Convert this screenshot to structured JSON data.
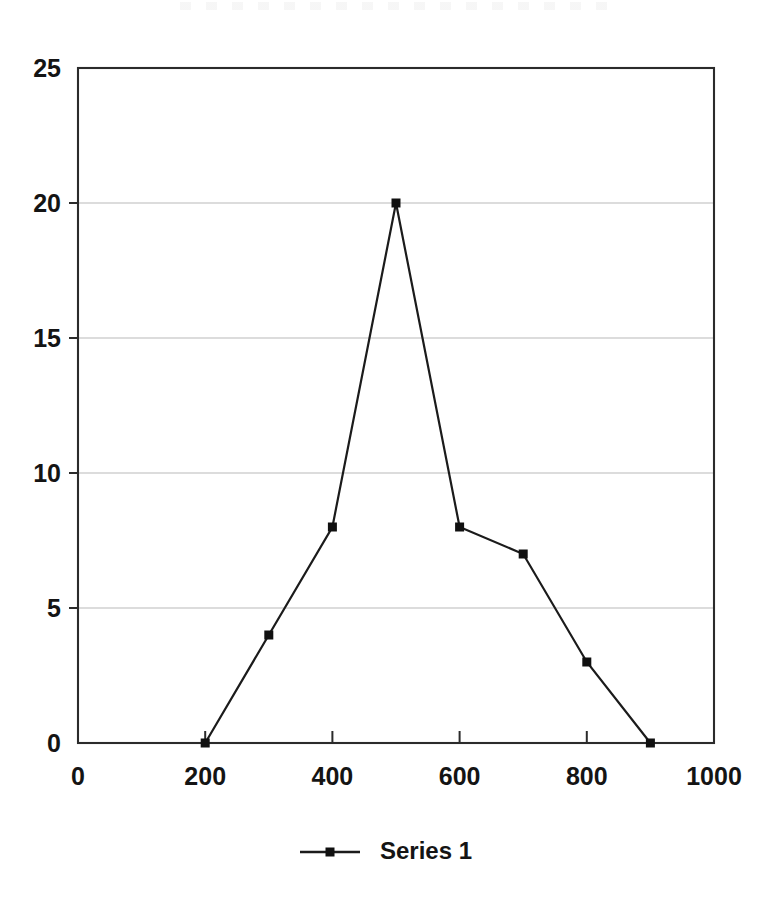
{
  "chart_data": {
    "type": "line",
    "title": "",
    "xlabel": "",
    "ylabel": "",
    "xlim": [
      0,
      1000
    ],
    "ylim": [
      0,
      25
    ],
    "xticks": [
      0,
      200,
      400,
      600,
      800,
      1000
    ],
    "yticks": [
      0,
      5,
      10,
      15,
      20,
      25
    ],
    "xtick_labels": [
      "0",
      "200",
      "400",
      "600",
      "800",
      "1000"
    ],
    "ytick_labels": [
      "0",
      "5",
      "10",
      "15",
      "20",
      "25"
    ],
    "grid": "horizontal",
    "gridline_values": [
      5,
      10,
      15,
      20
    ],
    "legend_position": "bottom-center",
    "marker": "square",
    "series": [
      {
        "name": "Series 1",
        "x": [
          200,
          300,
          400,
          500,
          600,
          700,
          800,
          900
        ],
        "values": [
          0,
          4,
          8,
          20,
          8,
          7,
          3,
          0
        ]
      }
    ]
  },
  "legend": {
    "entries": [
      {
        "label": "Series 1"
      }
    ]
  },
  "axes": {
    "y": {
      "labels": [
        "25",
        "20",
        "15",
        "10",
        "5",
        "0"
      ]
    },
    "x": {
      "labels": [
        "0",
        "200",
        "400",
        "600",
        "800",
        "1000"
      ]
    }
  },
  "colors": {
    "series_line": "#1b1b1b",
    "marker": "#101010",
    "gridline": "#b9b9b9",
    "frame": "#2b2b2b",
    "text": "#141414",
    "background": "#ffffff"
  }
}
